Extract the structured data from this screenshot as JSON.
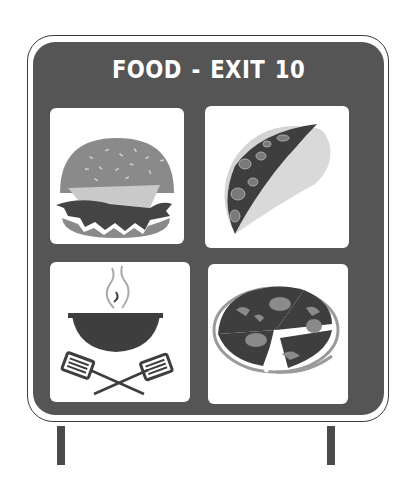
{
  "sign": {
    "title": "FOOD - EXIT 10",
    "background_color": "#555555",
    "text_color": "#ffffff",
    "panels": [
      {
        "position": "top-left",
        "icon": "hamburger-icon",
        "label": "Hamburger"
      },
      {
        "position": "top-right",
        "icon": "taco-icon",
        "label": "Taco"
      },
      {
        "position": "bottom-left",
        "icon": "barbecue-grill-icon",
        "label": "Barbecue"
      },
      {
        "position": "bottom-right",
        "icon": "pizza-icon",
        "label": "Pizza"
      }
    ]
  }
}
